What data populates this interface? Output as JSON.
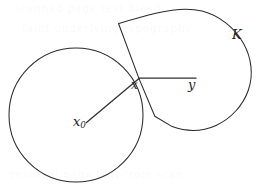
{
  "figure": {
    "kind": "geometric-diagram",
    "canvas": {
      "width": 263,
      "height": 195,
      "background": "#ffffff"
    },
    "stroke_color": "#2b2b2b",
    "label_color": "#1e1e1e",
    "labels": {
      "center_point": {
        "base": "x",
        "subscript": "0"
      },
      "touch_point": {
        "base": "x",
        "subscript": ""
      },
      "target_point": {
        "base": "y",
        "subscript": ""
      },
      "region": {
        "base": "K",
        "subscript": ""
      }
    },
    "shapes": {
      "circle": {
        "name": "ball-around-x0",
        "center_x": 76,
        "center_y": 115,
        "radius": 67
      },
      "region_k": {
        "name": "region-K",
        "path": "M 118.5 23.5 L 139.0 78.6 L 154.8 116.2 L 172.0 126.5 C 196.0 134.5 224.0 126.0 240.5 104.0 C 254.5 85.0 252.5 58.0 240.0 38.0 C 227.5 18.5 205.0 8.0 183.0 9.8 C 160.0 11.6 137.0 17.0 118.5 23.5 Z"
      },
      "radius_segment": {
        "name": "segment-x0-to-x",
        "x1": 86.5,
        "y1": 122.5,
        "x2": 139.0,
        "y2": 78.6
      },
      "chord_segment": {
        "name": "segment-x-to-y",
        "x1": 139.0,
        "y1": 78.2,
        "x2": 196.0,
        "y2": 78.2
      }
    }
  },
  "ghost": {
    "line1": "scanned page text bleed",
    "line2": "faint underlying typography",
    "line3": "residual page text from scan"
  }
}
